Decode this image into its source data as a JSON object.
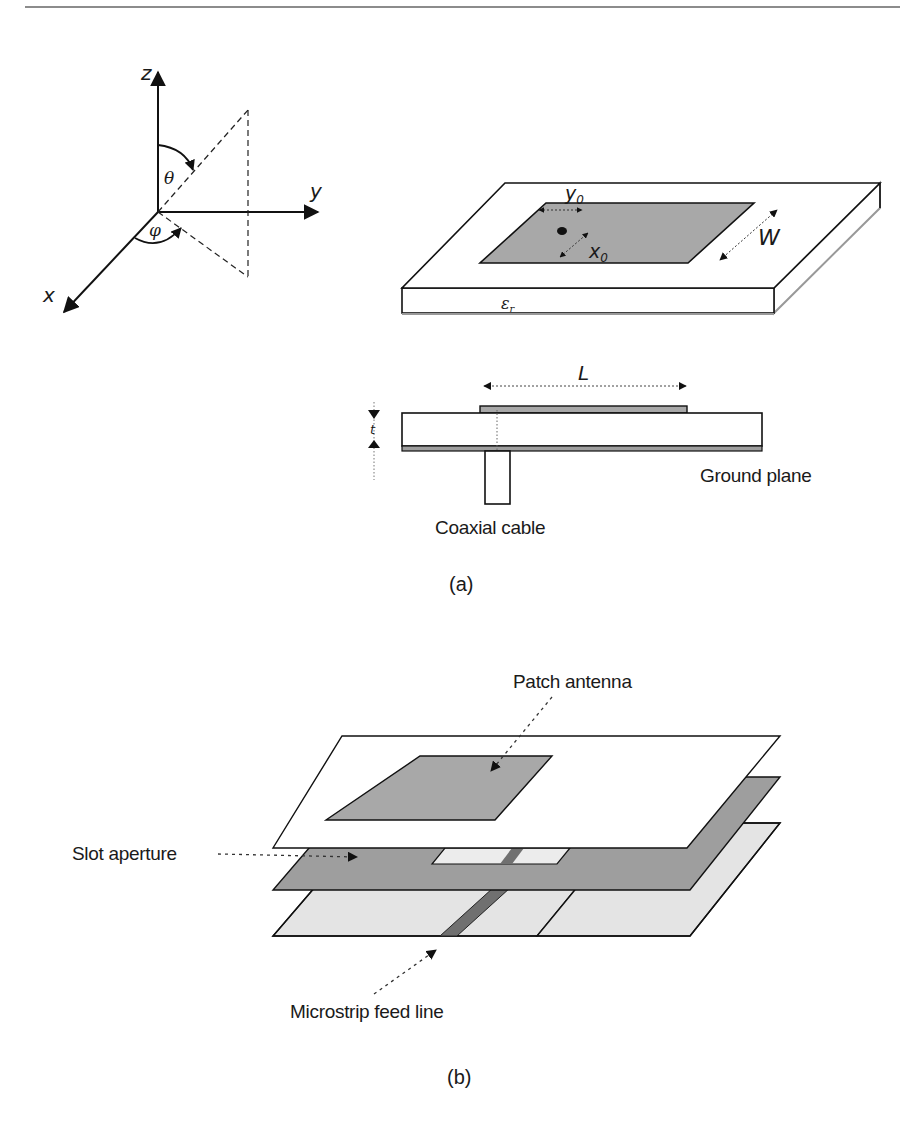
{
  "header": {
    "rule": true
  },
  "axes": {
    "z_label": "z",
    "y_label": "y",
    "x_label": "x",
    "theta_label": "θ",
    "phi_label": "φ"
  },
  "figure_a": {
    "caption": "(a)",
    "perspective": {
      "y0_label": "y",
      "y0_sub": "0",
      "x0_label": "x",
      "x0_sub": "0",
      "w_label": "W",
      "er_label": "ε",
      "er_sub": "r"
    },
    "side_view": {
      "l_label": "L",
      "t_label": "t",
      "ground_plane_label": "Ground plane",
      "coax_label": "Coaxial cable"
    }
  },
  "figure_b": {
    "caption": "(b)",
    "patch_antenna_label": "Patch antenna",
    "slot_aperture_label": "Slot aperture",
    "microstrip_label": "Microstrip feed line"
  },
  "colors": {
    "patch_gray": "#a8a8a8",
    "ground_gray": "#9e9e9e",
    "light_gray": "#e4e4e4",
    "feed_dark": "#707070",
    "line": "#111111"
  }
}
